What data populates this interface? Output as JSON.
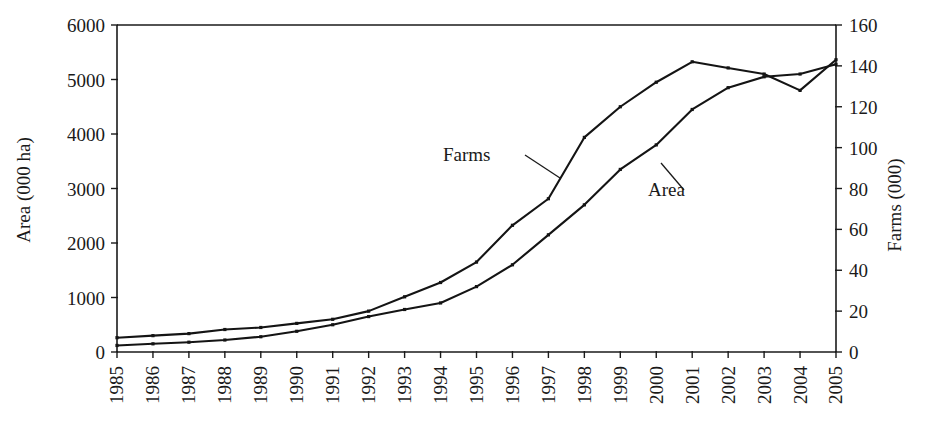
{
  "chart_data": {
    "type": "line",
    "title": "",
    "xlabel": "",
    "grid": false,
    "legend_position": "inline-annotations",
    "categories": [
      "1985",
      "1986",
      "1987",
      "1988",
      "1989",
      "1990",
      "1991",
      "1992",
      "1993",
      "1994",
      "1995",
      "1996",
      "1997",
      "1998",
      "1999",
      "2000",
      "2001",
      "2002",
      "2003",
      "2004",
      "2005"
    ],
    "x": [
      1985,
      1986,
      1987,
      1988,
      1989,
      1990,
      1991,
      1992,
      1993,
      1994,
      1995,
      1996,
      1997,
      1998,
      1999,
      2000,
      2001,
      2002,
      2003,
      2004,
      2005
    ],
    "axes": {
      "left": {
        "label": "Area (000 ha)",
        "ylim": [
          0,
          6000
        ],
        "ticks": [
          0,
          1000,
          2000,
          3000,
          4000,
          5000,
          6000
        ],
        "tick_labels": [
          "0",
          "1000",
          "2000",
          "3000",
          "4000",
          "5000",
          "6000"
        ]
      },
      "right": {
        "label": "Farms (000)",
        "ylim": [
          0,
          160
        ],
        "ticks": [
          0,
          20,
          40,
          60,
          80,
          100,
          120,
          140,
          160
        ],
        "tick_labels": [
          "0",
          "20",
          "40",
          "60",
          "80",
          "100",
          "120",
          "140",
          "160"
        ]
      }
    },
    "series": [
      {
        "name": "Farms",
        "axis": "right",
        "unit": "000",
        "annotation_label": "Farms",
        "values": [
          7,
          8,
          9,
          11,
          12,
          14,
          16,
          20,
          27,
          34,
          44,
          62,
          75,
          105,
          120,
          132,
          142,
          139,
          136,
          128,
          143
        ]
      },
      {
        "name": "Area",
        "axis": "left",
        "unit": "000 ha",
        "annotation_label": "Area",
        "values": [
          120,
          150,
          180,
          220,
          280,
          380,
          500,
          650,
          780,
          900,
          1200,
          1600,
          2150,
          2700,
          3350,
          3800,
          4450,
          4850,
          5050,
          5100,
          5280
        ]
      }
    ]
  },
  "annotations": {
    "farms_label": "Farms",
    "area_label": "Area"
  },
  "colors": {
    "ink": "#141414",
    "background": "#ffffff"
  }
}
